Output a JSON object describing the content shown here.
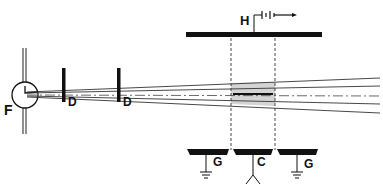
{
  "diagram": {
    "title": "",
    "colors": {
      "ink": "#111111",
      "shade": "#cfcfcf",
      "background": "#ffffff"
    },
    "labels": {
      "source": "F",
      "slit_1": "D",
      "slit_2": "D",
      "top_plate": "H",
      "ground_left": "G",
      "collector": "C",
      "ground_right": "G"
    },
    "components": [
      {
        "id": "source",
        "label": "F",
        "kind": "filament source (circle)"
      },
      {
        "id": "slit_1",
        "label": "D",
        "kind": "diaphragm"
      },
      {
        "id": "slit_2",
        "label": "D",
        "kind": "diaphragm"
      },
      {
        "id": "top_plate",
        "label": "H",
        "kind": "high-voltage plate with battery"
      },
      {
        "id": "ground_left",
        "label": "G",
        "kind": "grounded plate"
      },
      {
        "id": "collector",
        "label": "C",
        "kind": "collector plate"
      },
      {
        "id": "ground_right",
        "label": "G",
        "kind": "grounded plate"
      }
    ],
    "icons": {
      "battery": "battery-icon",
      "ground": "ground-icon",
      "arrow": "arrow-right-icon"
    }
  }
}
